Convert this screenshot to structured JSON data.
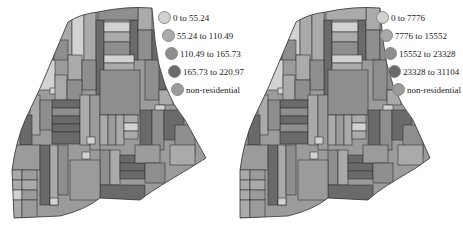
{
  "colors": {
    "class1": "#d2d2d2",
    "class2": "#aaaaaa",
    "class3": "#8e8e8e",
    "class4": "#6a6a6a",
    "non_residential": "#9b9b9b",
    "block_border": "#333333"
  },
  "maps": [
    {
      "id": "left",
      "legend": [
        {
          "label": "0 to 55.24",
          "color_key": "class1"
        },
        {
          "label": "55.24 to 110.49",
          "color_key": "class2"
        },
        {
          "label": "110.49 to 165.73",
          "color_key": "class3"
        },
        {
          "label": "165.73 to 220.97",
          "color_key": "class4"
        },
        {
          "label": "non-residential",
          "color_key": "non_residential"
        }
      ]
    },
    {
      "id": "right",
      "legend": [
        {
          "label": "0 to 7776",
          "color_key": "class1"
        },
        {
          "label": "7776 to 15552",
          "color_key": "class2"
        },
        {
          "label": "15552 to 23328",
          "color_key": "class3"
        },
        {
          "label": "23328 to 31104",
          "color_key": "class4"
        },
        {
          "label": "non-residential",
          "color_key": "non_residential"
        }
      ]
    }
  ]
}
